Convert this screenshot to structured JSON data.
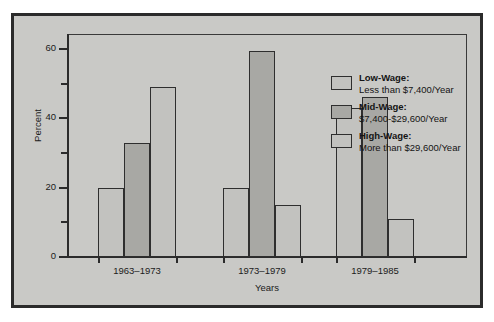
{
  "chart_data": {
    "type": "bar",
    "title": "",
    "xlabel": "Years",
    "ylabel": "Percent",
    "ylim": [
      0,
      64
    ],
    "yticks": [
      0,
      20,
      40,
      60
    ],
    "yticks_minor": [
      10,
      30,
      50
    ],
    "grid": false,
    "legend_position": "right",
    "categories": [
      "1963–1973",
      "1973–1979",
      "1979–1985"
    ],
    "series": [
      {
        "name": "Low-Wage",
        "legend_title": "Low-Wage:",
        "legend_desc": "Less than $7,400/Year",
        "color": "#c2c2bf",
        "values": [
          20,
          20,
          43
        ]
      },
      {
        "name": "Mid-Wage",
        "legend_title": "Mid-Wage:",
        "legend_desc": "$7,400-$29,600/Year",
        "color": "#a8a8a4",
        "values": [
          33,
          59.5,
          46
        ]
      },
      {
        "name": "High-Wage",
        "legend_title": "High-Wage:",
        "legend_desc": "More than $29,600/Year",
        "color": "#c2c2bf",
        "values": [
          49,
          15,
          11
        ]
      }
    ]
  },
  "axis": {
    "y_title": "Percent",
    "x_title": "Years",
    "y_tick_labels": [
      "0",
      "20",
      "40",
      "60"
    ]
  },
  "colors": {
    "background": "#c9c9c6",
    "frame": "#2b2b2b",
    "bar_light": "#c2c2bf",
    "bar_dark": "#a8a8a4",
    "text": "#1b1b1b"
  }
}
